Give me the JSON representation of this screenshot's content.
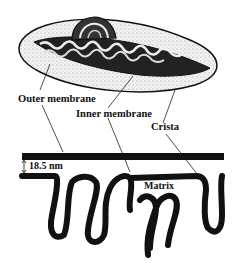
{
  "labels": {
    "outer_membrane": "Outer membrane",
    "inner_membrane": "Inner membrane",
    "crista": "Crista",
    "matrix": "Matrix",
    "gap_measure": "18.5 nm"
  },
  "colors": {
    "ink": "#111111",
    "background": "#ffffff",
    "stipple": "#d8d8d8"
  }
}
